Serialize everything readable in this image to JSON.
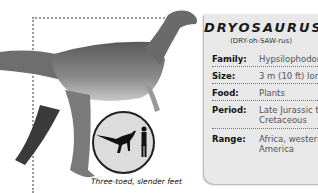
{
  "title": "DRYOSAURUS",
  "pronunciation": "(DRY-oh-SAW-rus)",
  "facts": [
    {
      "label": "Family:",
      "value": [
        "Hypsilophodonti"
      ]
    },
    {
      "label": "Size:",
      "value": [
        "3 m (10 ft) long"
      ]
    },
    {
      "label": "Food:",
      "value": [
        "Plants"
      ]
    },
    {
      "label": "Period:",
      "value": [
        "Late Jurassic to E",
        "Cretaceous"
      ]
    },
    {
      "label": "Range:",
      "value": [
        "Africa, western N",
        "America"
      ]
    }
  ],
  "caption": "Three-toed, slender feet",
  "icons": {
    "scale_comparison": "dinosaur-vs-human-silhouette"
  }
}
